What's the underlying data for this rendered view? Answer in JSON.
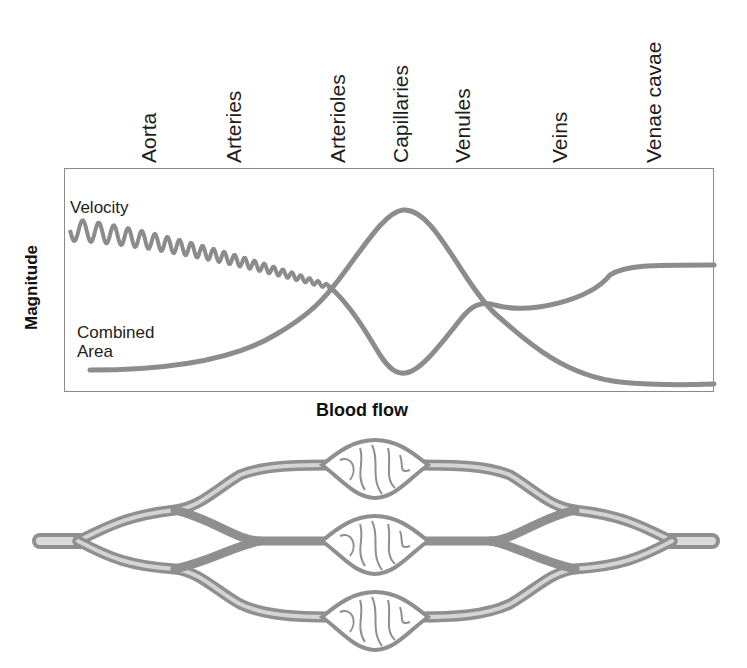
{
  "stages": [
    {
      "label": "Aorta",
      "x": 150
    },
    {
      "label": "Arteries",
      "x": 246
    },
    {
      "label": "Arterioles",
      "x": 350
    },
    {
      "label": "Capillaries",
      "x": 413
    },
    {
      "label": "Venules",
      "x": 475
    },
    {
      "label": "Veins",
      "x": 572
    },
    {
      "label": "Venae cavae",
      "x": 666
    }
  ],
  "axes": {
    "ylabel": "Magnitude",
    "xlabel": "Blood flow"
  },
  "series_labels": {
    "velocity": "Velocity",
    "combined_area_line1": "Combined",
    "combined_area_line2": "Area"
  },
  "colors": {
    "curve": "#8c8c8c",
    "frame": "#8a8a8a",
    "vessel": "#9a9a9a",
    "vessel_light": "#d6d6d6"
  },
  "chart_data": {
    "type": "line",
    "title": "",
    "xlabel": "Blood flow",
    "ylabel": "Magnitude",
    "categories": [
      "Aorta",
      "Arteries",
      "Arterioles",
      "Capillaries",
      "Venules",
      "Veins",
      "Venae cavae"
    ],
    "series": [
      {
        "name": "Velocity",
        "note": "pulsatile (oscillating) from aorta through arterioles, then smooth",
        "values": [
          0.82,
          0.68,
          0.47,
          0.08,
          0.33,
          0.15,
          0.05
        ]
      },
      {
        "name": "Combined Area",
        "values": [
          0.1,
          0.15,
          0.45,
          0.88,
          0.42,
          0.55,
          0.57
        ]
      }
    ],
    "ylim": [
      0,
      1
    ],
    "grid": false,
    "legend": "inline labels at left"
  },
  "illustration": {
    "description": "Branching vessel network: single artery splits into branches, three capillary beds, rejoining into single vein",
    "capillary_beds": 3
  }
}
